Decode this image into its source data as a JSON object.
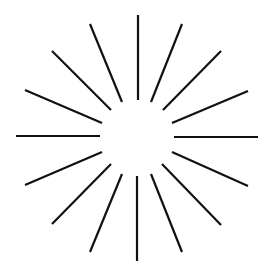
{
  "figure": {
    "type": "radial-burst",
    "width": 270,
    "height": 279,
    "background": "#ffffff",
    "stroke_color": "#111111",
    "stroke_width": 2.2,
    "ray_count": 16,
    "center": [
      137,
      137
    ],
    "rays": [
      {
        "name": "ray-n",
        "x1": 138,
        "y1": 15,
        "x2": 138,
        "y2": 100
      },
      {
        "name": "ray-nne",
        "x1": 182,
        "y1": 24,
        "x2": 151,
        "y2": 102
      },
      {
        "name": "ray-ne",
        "x1": 221,
        "y1": 51,
        "x2": 163,
        "y2": 110
      },
      {
        "name": "ray-ene",
        "x1": 248,
        "y1": 91,
        "x2": 172,
        "y2": 123
      },
      {
        "name": "ray-e",
        "x1": 174,
        "y1": 137,
        "x2": 258,
        "y2": 137
      },
      {
        "name": "ray-ese",
        "x1": 172,
        "y1": 152,
        "x2": 248,
        "y2": 186
      },
      {
        "name": "ray-se",
        "x1": 162,
        "y1": 164,
        "x2": 221,
        "y2": 225
      },
      {
        "name": "ray-sse",
        "x1": 151,
        "y1": 174,
        "x2": 182,
        "y2": 252
      },
      {
        "name": "ray-s",
        "x1": 137,
        "y1": 176,
        "x2": 137,
        "y2": 261
      },
      {
        "name": "ray-ssw",
        "x1": 122,
        "y1": 174,
        "x2": 90,
        "y2": 252
      },
      {
        "name": "ray-sw",
        "x1": 111,
        "y1": 164,
        "x2": 52,
        "y2": 224
      },
      {
        "name": "ray-wsw",
        "x1": 102,
        "y1": 152,
        "x2": 25,
        "y2": 185
      },
      {
        "name": "ray-w",
        "x1": 16,
        "y1": 136,
        "x2": 100,
        "y2": 136
      },
      {
        "name": "ray-wnw",
        "x1": 25,
        "y1": 90,
        "x2": 102,
        "y2": 123
      },
      {
        "name": "ray-nw",
        "x1": 52,
        "y1": 51,
        "x2": 111,
        "y2": 110
      },
      {
        "name": "ray-nnw",
        "x1": 90,
        "y1": 24,
        "x2": 122,
        "y2": 102
      }
    ]
  }
}
